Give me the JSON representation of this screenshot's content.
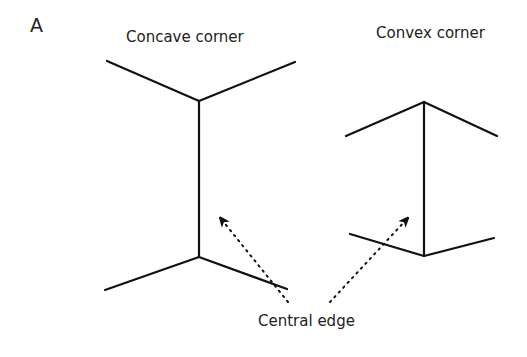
{
  "panel_label": "A",
  "titles": {
    "concave": "Concave corner",
    "convex": "Convex corner"
  },
  "annotation": "Central edge",
  "colors": {
    "line": "#111111",
    "text": "#222222",
    "background": "#ffffff"
  },
  "figures": [
    {
      "name": "concave-corner",
      "top_vertex": [
        199,
        101
      ],
      "bottom_vertex": [
        199,
        257
      ],
      "top_arms": [
        [
          107,
          61
        ],
        [
          295,
          62
        ]
      ],
      "bottom_arms": [
        [
          105,
          290
        ],
        [
          287,
          289
        ]
      ]
    },
    {
      "name": "convex-corner",
      "top_vertex": [
        424,
        102
      ],
      "bottom_vertex": [
        424,
        256
      ],
      "top_arms": [
        [
          346,
          136
        ],
        [
          497,
          136
        ]
      ],
      "bottom_arms": [
        [
          350,
          234
        ],
        [
          494,
          238
        ]
      ]
    }
  ],
  "arrows": [
    {
      "from": [
        288,
        302
      ],
      "to": [
        220,
        218
      ],
      "style": "dotted"
    },
    {
      "from": [
        330,
        302
      ],
      "to": [
        408,
        218
      ],
      "style": "dotted"
    }
  ]
}
